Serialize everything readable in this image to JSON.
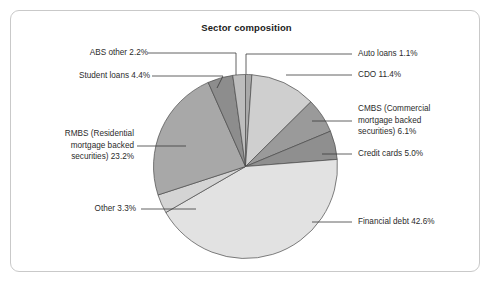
{
  "figure": {
    "title": "Sector composition",
    "background": "#ffffff",
    "border_color": "#c9c9c9"
  },
  "chart_data": {
    "type": "pie",
    "title": "Sector composition",
    "xlabel": "",
    "ylabel": "",
    "legend_position": "callout-labels",
    "grid": false,
    "units": "percent",
    "start_angle_deg": 0,
    "direction": "clockwise",
    "categories": [
      "Auto loans",
      "CDO",
      "CMBS (Commercial mortgage backed securities)",
      "Credit cards",
      "Financial debt",
      "Other",
      "RMBS (Residential mortgage backed securities)",
      "Student loans",
      "ABS other"
    ],
    "values": [
      1.1,
      11.4,
      6.1,
      5.0,
      42.6,
      3.3,
      23.2,
      4.4,
      2.2
    ],
    "colors": [
      "#a9a9a9",
      "#cfcfcf",
      "#9a9a9a",
      "#8f8f8f",
      "#e2e2e2",
      "#d4d4d4",
      "#a8a8a8",
      "#8d8d8d",
      "#bdbdbd"
    ],
    "slice_labels": [
      "Auto loans 1.1%",
      "CDO 11.4%",
      "CMBS (Commercial mortgage backed securities) 6.1%",
      "Credit cards 5.0%",
      "Financial debt 42.6%",
      "Other 3.3%",
      "RMBS (Residential mortgage backed securities) 23.2%",
      "Student loans 4.4%",
      "ABS other 2.2%"
    ]
  },
  "callouts": {
    "abs_other": "ABS other 2.2%",
    "student_loans": "Student loans 4.4%",
    "rmbs_line1": "RMBS (Residential",
    "rmbs_line2": "mortgage backed",
    "rmbs_line3": "securities) 23.2%",
    "other": "Other 3.3%",
    "auto_loans": "Auto loans 1.1%",
    "cdo": "CDO 11.4%",
    "cmbs_line1": "CMBS (Commercial",
    "cmbs_line2": "mortgage backed",
    "cmbs_line3": "securities) 6.1%",
    "credit_cards": "Credit cards 5.0%",
    "financial_debt": "Financial debt 42.6%"
  }
}
